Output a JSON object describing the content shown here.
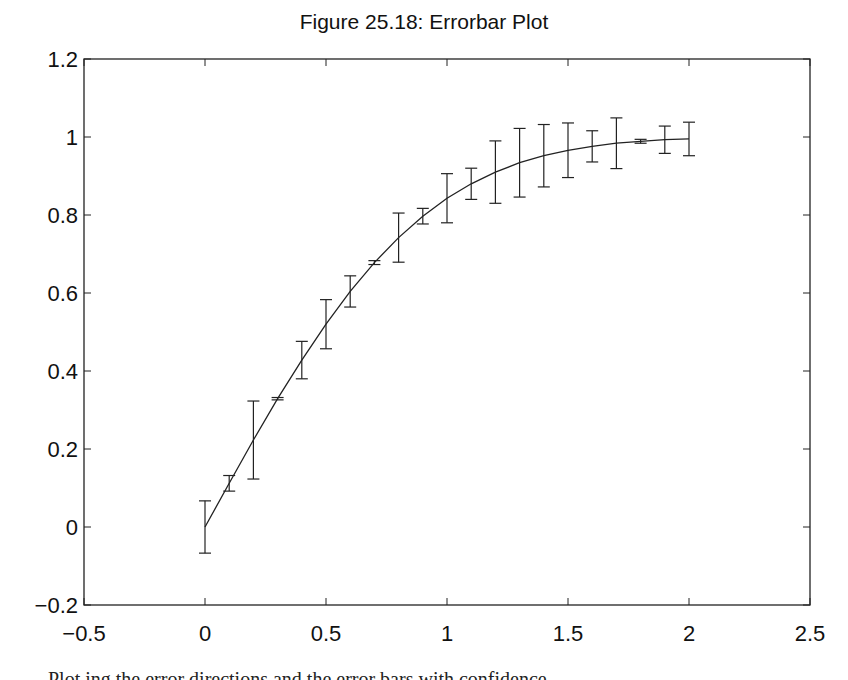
{
  "caption": "Plot ing  the  error  directions  and  the  error  bars  with  confidence",
  "chart_data": {
    "type": "line",
    "title": "Figure 25.18: Errorbar Plot",
    "xlabel": "",
    "ylabel": "",
    "xlim": [
      -0.5,
      2.5
    ],
    "ylim": [
      -0.2,
      1.2
    ],
    "grid": false,
    "legend": null,
    "xticks": [
      "-0.5",
      "0",
      "0.5",
      "1",
      "1.5",
      "2",
      "2.5"
    ],
    "yticks": [
      "-0.2",
      "0",
      "0.2",
      "0.4",
      "0.6",
      "0.8",
      "1",
      "1.2"
    ],
    "x": [
      0,
      0.1,
      0.2,
      0.3,
      0.4,
      0.5,
      0.6,
      0.7,
      0.8,
      0.9,
      1.0,
      1.1,
      1.2,
      1.3,
      1.4,
      1.5,
      1.6,
      1.7,
      1.8,
      1.9,
      2.0
    ],
    "series": [
      {
        "name": "erf(x)",
        "values": [
          0,
          0.112,
          0.223,
          0.329,
          0.428,
          0.52,
          0.604,
          0.678,
          0.742,
          0.797,
          0.843,
          0.88,
          0.91,
          0.934,
          0.952,
          0.966,
          0.976,
          0.984,
          0.989,
          0.993,
          0.995
        ],
        "errors": [
          0.067,
          0.02,
          0.1,
          0.003,
          0.048,
          0.063,
          0.04,
          0.005,
          0.063,
          0.02,
          0.063,
          0.04,
          0.08,
          0.088,
          0.08,
          0.07,
          0.04,
          0.065,
          0.005,
          0.035,
          0.043
        ]
      }
    ]
  }
}
